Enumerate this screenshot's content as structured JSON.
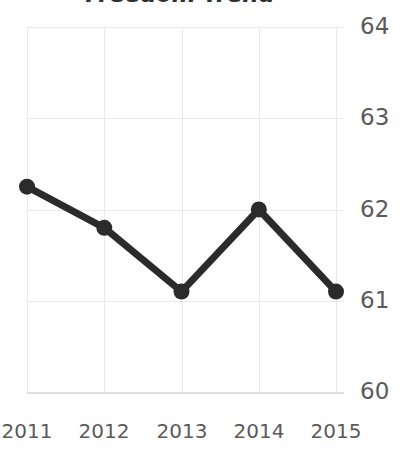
{
  "chart_data": {
    "type": "line",
    "title": "Freedom Trend",
    "xlabel": "",
    "ylabel": "",
    "categories": [
      "2011",
      "2012",
      "2013",
      "2014",
      "2015"
    ],
    "x": [
      2011,
      2012,
      2013,
      2014,
      2015
    ],
    "values": [
      62.25,
      61.8,
      61.1,
      62.0,
      61.1
    ],
    "series": [
      {
        "name": "Freedom Score",
        "values": [
          62.25,
          61.8,
          61.1,
          62.0,
          61.1
        ]
      }
    ],
    "ylim": [
      60,
      64
    ],
    "xlim": [
      2011,
      2015
    ],
    "y_ticks": [
      64,
      63,
      62,
      61,
      60
    ],
    "y_tick_labels": [
      "64",
      "63",
      "62",
      "61",
      "60"
    ],
    "x_ticks": [
      2011,
      2012,
      2013,
      2014,
      2015
    ],
    "x_tick_labels": [
      "2011",
      "2012",
      "2013",
      "2014",
      "2015"
    ],
    "grid": true,
    "grid_axes": "both",
    "legend": false,
    "legend_position": "none",
    "markers": true,
    "marker_shape": "circle",
    "annotations": [],
    "colors": {
      "line": "#2b2b2b",
      "marker": "#2b2b2b",
      "grid": "#e9e9e9",
      "axis": "#dedede",
      "tick_label": "#5a5a5a",
      "title": "#2f2f2f",
      "background": "#ffffff"
    }
  }
}
